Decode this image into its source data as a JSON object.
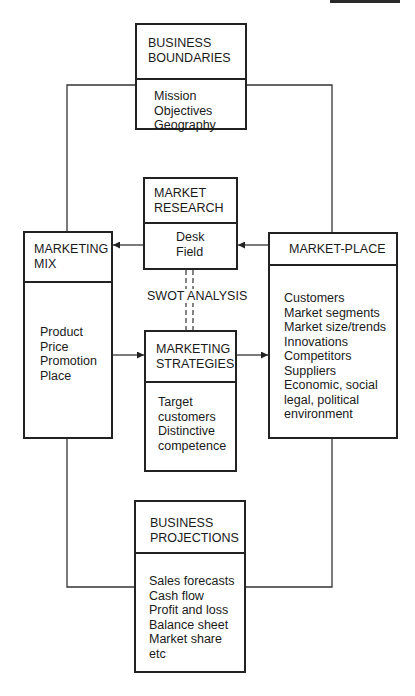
{
  "diagram": {
    "type": "marketing-plan-flow",
    "boxes": {
      "business_boundaries": {
        "title": [
          "BUSINESS",
          "BOUNDARIES"
        ],
        "items": [
          "Mission",
          "Objectives",
          "Geography"
        ]
      },
      "market_research": {
        "title": [
          "MARKET",
          "RESEARCH"
        ],
        "items": [
          "Desk",
          "Field"
        ]
      },
      "marketing_mix": {
        "title": [
          "MARKETING",
          "MIX"
        ],
        "items": [
          "Product",
          "Price",
          "Promotion",
          "Place"
        ]
      },
      "market_place": {
        "title": [
          "MARKET-PLACE"
        ],
        "items": [
          "Customers",
          "Market segments",
          "Market size/trends",
          "Innovations",
          "Competitors",
          "Suppliers",
          "Economic, social",
          "legal, political",
          "environment"
        ]
      },
      "marketing_strategies": {
        "title": [
          "MARKETING",
          "STRATEGIES"
        ],
        "items": [
          "Target",
          "customers",
          "Distinctive",
          "competence"
        ]
      },
      "business_projections": {
        "title": [
          "BUSINESS",
          "PROJECTIONS"
        ],
        "items": [
          "Sales forecasts",
          "Cash flow",
          "Profit and loss",
          "Balance sheet",
          "Market share",
          "etc"
        ]
      }
    },
    "labels": {
      "swot": "SWOT ANALYSIS"
    },
    "edges": [
      {
        "from": "market_research",
        "to": "marketing_mix",
        "style": "arrow"
      },
      {
        "from": "market_place",
        "to": "market_research",
        "style": "arrow"
      },
      {
        "from": "marketing_mix",
        "to": "marketing_strategies",
        "style": "arrow"
      },
      {
        "from": "marketing_strategies",
        "to": "market_place",
        "style": "arrow"
      },
      {
        "from": "market_research",
        "to": "marketing_strategies",
        "style": "dashed",
        "label": "SWOT ANALYSIS"
      },
      {
        "from": "business_boundaries",
        "to": "marketing_mix",
        "style": "line"
      },
      {
        "from": "business_boundaries",
        "to": "market_place",
        "style": "line"
      },
      {
        "from": "marketing_mix",
        "to": "business_projections",
        "style": "line"
      },
      {
        "from": "market_place",
        "to": "business_projections",
        "style": "line"
      }
    ]
  }
}
